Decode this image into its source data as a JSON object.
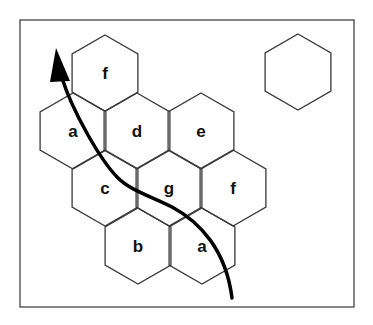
{
  "diagram": {
    "frame": {
      "x": 20,
      "y": 20,
      "width": 334,
      "height": 287,
      "stroke": "#444444"
    },
    "hex_size": 38,
    "hexes": [
      {
        "label": "f",
        "cx": 105,
        "cy": 73
      },
      {
        "label": "a",
        "cx": 73,
        "cy": 131
      },
      {
        "label": "d",
        "cx": 137,
        "cy": 131
      },
      {
        "label": "e",
        "cx": 201,
        "cy": 131
      },
      {
        "label": "c",
        "cx": 105,
        "cy": 188
      },
      {
        "label": "g",
        "cx": 169,
        "cy": 188
      },
      {
        "label": "f",
        "cx": 233,
        "cy": 188
      },
      {
        "label": "b",
        "cx": 138,
        "cy": 246
      },
      {
        "label": "a",
        "cx": 202,
        "cy": 246
      }
    ],
    "standalone_hex": {
      "label": "",
      "cx": 298,
      "cy": 72
    },
    "arrow": {
      "path": "M232,298 C226,250 200,222 172,207 C150,196 130,190 118,178 C100,160 72,110 62,78",
      "color": "#000000",
      "head_tip": [
        56,
        48
      ]
    }
  }
}
